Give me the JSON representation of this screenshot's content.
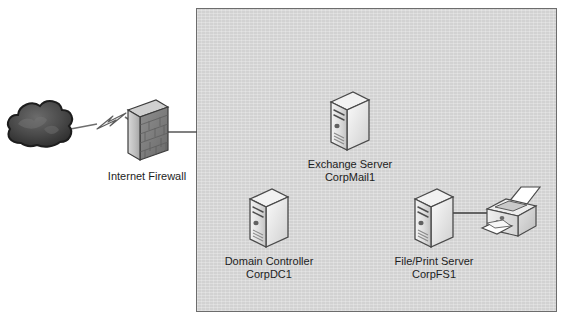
{
  "diagram": {
    "background_color": "#ffffff",
    "zone": {
      "name": "internal-network-zone",
      "fill_color": "#d2d2d2",
      "border_color": "#6d6d6d"
    },
    "nodes": [
      {
        "id": "internet-cloud",
        "icon": "cloud-icon",
        "label_line1": "",
        "label_line2": "",
        "color": "#3f3f3f"
      },
      {
        "id": "internet-firewall",
        "icon": "firewall-brick-wall-icon",
        "label_line1": "Internet Firewall",
        "label_line2": "",
        "color": "#b8b8b8"
      },
      {
        "id": "exchange-server",
        "icon": "server-tower-icon",
        "label_line1": "Exchange Server",
        "label_line2": "CorpMail1",
        "color": "#e8e8e8"
      },
      {
        "id": "domain-controller",
        "icon": "server-tower-icon",
        "label_line1": "Domain Controller",
        "label_line2": "CorpDC1",
        "color": "#e8e8e8"
      },
      {
        "id": "file-print-server",
        "icon": "server-tower-icon",
        "label_line1": "File/Print Server",
        "label_line2": "CorpFS1",
        "color": "#e8e8e8"
      },
      {
        "id": "network-printer",
        "icon": "laser-printer-icon",
        "label_line1": "",
        "label_line2": "",
        "color": "#e0e0e0"
      }
    ],
    "connections": [
      {
        "id": "cloud-to-firewall",
        "style": "lightning-bolt-link",
        "from": "internet-cloud",
        "to": "internet-firewall"
      },
      {
        "id": "firewall-to-zone",
        "style": "solid-line",
        "from": "internet-firewall",
        "to": "internal-network-zone"
      },
      {
        "id": "server-to-printer",
        "style": "solid-line",
        "from": "file-print-server",
        "to": "network-printer"
      }
    ]
  }
}
